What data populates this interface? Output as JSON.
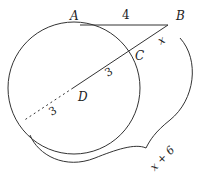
{
  "diagram": {
    "type": "geometry",
    "colors": {
      "stroke": "#333333",
      "background": "#ffffff"
    },
    "points": {
      "A": {
        "label": "A"
      },
      "B": {
        "label": "B"
      },
      "C": {
        "label": "C"
      },
      "D": {
        "label": "D"
      }
    },
    "measures": {
      "AB": "4",
      "BC": "x",
      "CD": "3",
      "D_to_circle_dashed": "3",
      "brace_total": "x + 6"
    }
  }
}
